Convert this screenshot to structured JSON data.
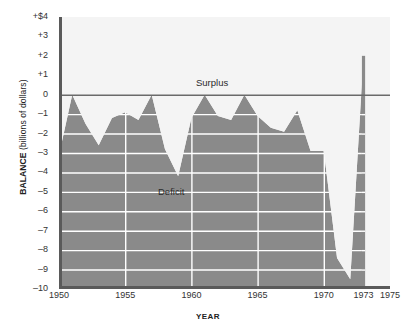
{
  "chart_data": {
    "type": "area",
    "title": "",
    "subtitle": "",
    "xlabel": "YEAR",
    "ylabel": "BALANCE (billions of dollars)",
    "ylabel_bold_part": "BALANCE",
    "ylabel_rest": " (billions of dollars)",
    "xlim": [
      1950,
      1975
    ],
    "ylim": [
      -10,
      4
    ],
    "grid": true,
    "grid_color": "#ffffff",
    "legend": "none",
    "series_name": "Federal budget balance",
    "x_ticks": [
      1950,
      1955,
      1960,
      1965,
      1970,
      1973,
      1975
    ],
    "x_tick_labels": [
      "1950",
      "1955",
      "1960",
      "1965",
      "1970",
      "1973",
      "1975"
    ],
    "y_ticks": [
      4,
      3,
      2,
      1,
      0,
      -1,
      -2,
      -3,
      -4,
      -5,
      -6,
      -7,
      -8,
      -9,
      -10
    ],
    "y_tick_labels": [
      "+$4",
      "+3",
      "+2",
      "+1",
      "0",
      "–1",
      "–2",
      "–3",
      "–4",
      "–5",
      "–6",
      "–7",
      "–8",
      "–9",
      "–10"
    ],
    "x": [
      1950,
      1951,
      1952,
      1953,
      1954,
      1955,
      1956,
      1957,
      1958,
      1959,
      1960,
      1961,
      1962,
      1963,
      1964,
      1965,
      1966,
      1967,
      1968,
      1969,
      1970,
      1971,
      1972,
      1973
    ],
    "values": [
      -3.1,
      0.0,
      -1.5,
      -2.6,
      -1.2,
      -0.9,
      -1.3,
      0.0,
      -2.8,
      -4.2,
      -1.2,
      0.0,
      -1.1,
      -1.3,
      0.0,
      -1.1,
      -1.7,
      -1.9,
      -0.8,
      -2.9,
      -2.9,
      -8.4,
      -9.5,
      2.0
    ],
    "annotations": [
      {
        "text": "Surplus",
        "x": 1963.0,
        "y": 0.55
      },
      {
        "text": "Deficit",
        "x": 1958.2,
        "y": -5.4
      }
    ],
    "area_fill_color": "#8a8a8a",
    "plot_background_color": "#f4f4f4",
    "axis_color": "#5a5a5a",
    "tick_label_color": "#333333",
    "data_ends_at": 1973
  },
  "annotations": {
    "surplus": "Surplus",
    "deficit": "Deficit"
  },
  "axis": {
    "y_title_bold": "BALANCE",
    "y_title_rest": " (billions of dollars)",
    "x_title": "YEAR"
  }
}
